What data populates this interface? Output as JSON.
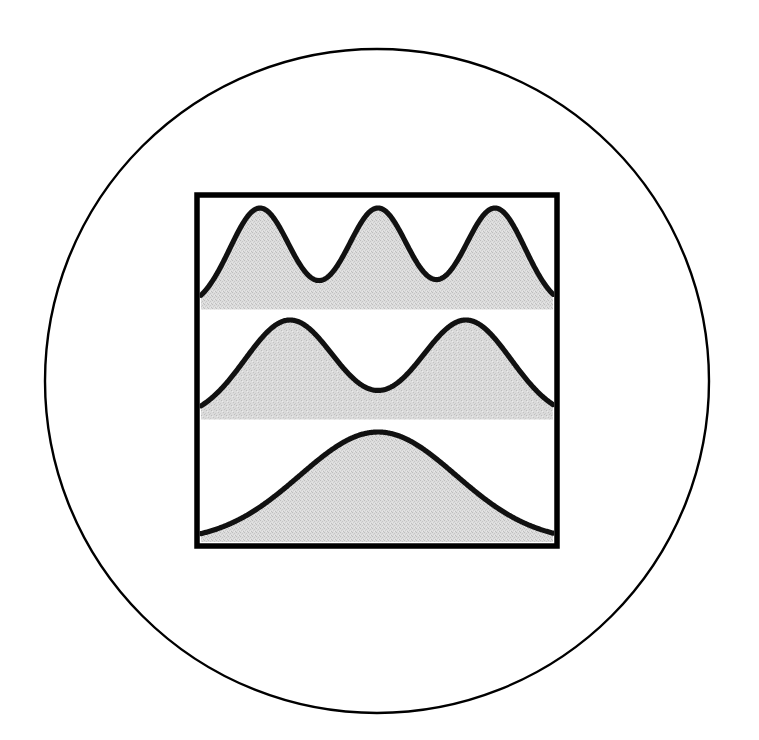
{
  "figure": {
    "canvas": {
      "width": 759,
      "height": 740,
      "background": "#ffffff"
    },
    "circle": {
      "name": "outer-circle-outline",
      "center_x": 377,
      "center_y": 381,
      "radius": 332,
      "stroke": "#000000",
      "stroke_width": 2.4,
      "fill": "none"
    },
    "frame": {
      "name": "plot-frame",
      "x": 197,
      "y": 195,
      "width": 360,
      "height": 351,
      "stroke": "#000000",
      "stroke_width": 5.5,
      "fill": "#ffffff"
    },
    "style": {
      "curve_stroke": "#111111",
      "curve_stroke_width": 5.2,
      "fill_color": "#d9d9d9",
      "fill_color_dark": "#cfcfcf",
      "baseline_stroke": "#000000"
    }
  },
  "chart_data": {
    "type": "area",
    "subtitle": "Superposition of equal-intensity Gaussian (Airy-like) peaks at three separations",
    "xlabel": "",
    "ylabel": "",
    "grid": false,
    "legend": "none",
    "axis_ranges": {
      "x": [
        0,
        1
      ],
      "y": [
        0,
        1
      ]
    },
    "panel_count": 3,
    "panels": [
      {
        "index": 0,
        "name": "panel-resolved",
        "label": "Well resolved — three distinct peaks",
        "peak_count": 3,
        "plot_x": 201,
        "plot_y": 199,
        "plot_width": 352,
        "plot_height": 111,
        "baseline_y": 310,
        "peak_positions_px": [
          260,
          378,
          495
        ],
        "peak_top_y_px": 208,
        "valley_positions_px": [
          319,
          437
        ],
        "valley_bottom_y_px": 305,
        "sigma_px": 30,
        "separation_px": 117,
        "normalized": {
          "centers": [
            0.168,
            0.503,
            0.835
          ],
          "sigma": 0.085,
          "amplitudes": [
            1.0,
            1.0,
            1.0
          ],
          "valley_depth_fraction": 0.06
        }
      },
      {
        "index": 1,
        "name": "panel-marginally-resolved",
        "label": "Marginally resolved — two peaks, valley reaches baseline",
        "peak_count": 2,
        "plot_x": 201,
        "plot_y": 310,
        "plot_width": 352,
        "plot_height": 110,
        "baseline_y": 420,
        "peak_positions_px": [
          290,
          466
        ],
        "peak_top_y_px": 320,
        "valley_positions_px": [
          378
        ],
        "valley_bottom_y_px": 417,
        "sigma_px": 45,
        "separation_px": 176,
        "normalized": {
          "centers": [
            0.253,
            0.753
          ],
          "sigma": 0.128,
          "amplitudes": [
            1.0,
            1.0
          ],
          "valley_depth_fraction": 0.03
        }
      },
      {
        "index": 2,
        "name": "panel-unresolved",
        "label": "Unresolved — single merged broad peak",
        "peak_count": 1,
        "plot_x": 201,
        "plot_y": 420,
        "plot_width": 352,
        "plot_height": 122,
        "baseline_y": 542,
        "peak_positions_px": [
          378
        ],
        "peak_top_y_px": 432,
        "valley_positions_px": [],
        "valley_bottom_y_px": null,
        "sigma_px": 78,
        "separation_px": 0,
        "normalized": {
          "centers": [
            0.503
          ],
          "sigma": 0.222,
          "amplitudes": [
            1.0
          ],
          "valley_depth_fraction": 0.0
        }
      }
    ]
  }
}
